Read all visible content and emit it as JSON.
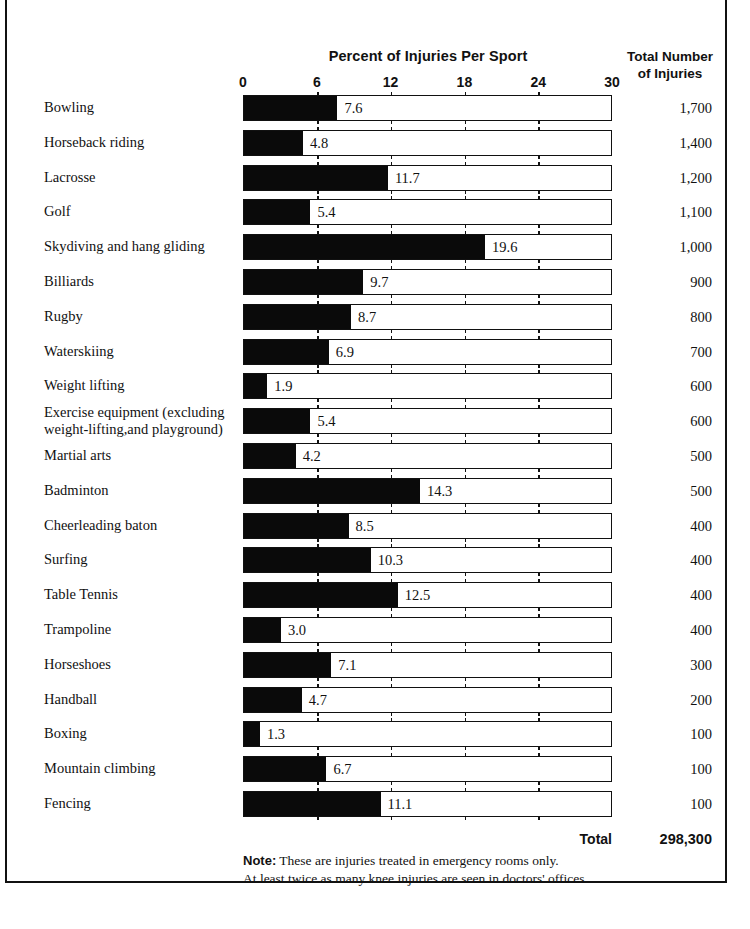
{
  "header": {
    "chart_title": "Percent of Injuries Per Sport",
    "totals_title_line1": "Total Number",
    "totals_title_line2": "of Injuries"
  },
  "footer": {
    "total_label": "Total",
    "total_value": "298,300",
    "note_prefix": "Note:",
    "note_line1": " These are injuries treated in emergency rooms only.",
    "note_line2": "At least twice as many knee injuries are seen in doctors' offices."
  },
  "chart_data": {
    "type": "bar",
    "title": "Percent of Injuries Per Sport",
    "xlabel": "",
    "ylabel": "",
    "xlim": [
      0,
      30
    ],
    "xticks": [
      0,
      6,
      12,
      18,
      24,
      30
    ],
    "xtick_labels": [
      "0",
      "6",
      "12",
      "18",
      "24",
      "30"
    ],
    "grid": false,
    "orientation": "horizontal",
    "bar_color": "#0a0a0a",
    "categories": [
      "Bowling",
      "Horseback riding",
      "Lacrosse",
      "Golf",
      "Skydiving and hang gliding",
      "Billiards",
      "Rugby",
      "Waterskiing",
      "Weight  lifting",
      "Exercise equipment (excluding\n    weight-lifting,and playground)",
      "Martial arts",
      "Badminton",
      "Cheerleading baton",
      "Surfing",
      "Table Tennis",
      "Trampoline",
      "Horseshoes",
      "Handball",
      "Boxing",
      "Mountain climbing",
      "Fencing"
    ],
    "values": [
      7.6,
      4.8,
      11.7,
      5.4,
      19.6,
      9.7,
      8.7,
      6.9,
      1.9,
      5.4,
      4.2,
      14.3,
      8.5,
      10.3,
      12.5,
      3.0,
      7.1,
      4.7,
      1.3,
      6.7,
      11.1
    ],
    "value_labels": [
      "7.6",
      "4.8",
      "11.7",
      "5.4",
      "19.6",
      "9.7",
      "8.7",
      "6.9",
      "1.9",
      "5.4",
      "4.2",
      "14.3",
      "8.5",
      "10.3",
      "12.5",
      "3.0",
      "7.1",
      "4.7",
      "1.3",
      "6.7",
      "11.1"
    ],
    "totals": [
      "1,700",
      "1,400",
      "1,200",
      "1,100",
      "1,000",
      "900",
      "800",
      "700",
      "600",
      "600",
      "500",
      "500",
      "400",
      "400",
      "400",
      "400",
      "300",
      "200",
      "100",
      "100",
      "100"
    ],
    "total_sum": "298,300"
  }
}
